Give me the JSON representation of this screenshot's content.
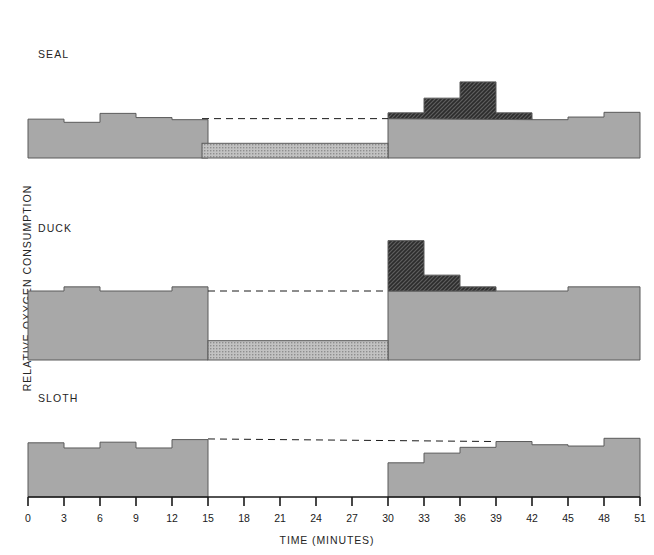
{
  "figure": {
    "ylabel": "RELATIVE OXYGEN CONSUMPTION",
    "xlabel": "TIME (MINUTES)",
    "panel_titles": {
      "seal": "SEAL",
      "duck": "DUCK",
      "sloth": "SLOTH"
    },
    "colors": {
      "baseline_fill": "#a8a8a8",
      "excess_fill": "#4a4a4a",
      "deficit_fill": "#b9b9b9",
      "outline": "#5a5a5a",
      "axis": "#1a1a1a",
      "text": "#252525"
    }
  },
  "axis": {
    "tick_labels": [
      "0",
      "3",
      "6",
      "9",
      "12",
      "15",
      "18",
      "21",
      "24",
      "27",
      "30",
      "33",
      "36",
      "39",
      "42",
      "45",
      "48",
      "51"
    ],
    "tick_values": [
      0,
      3,
      6,
      9,
      12,
      15,
      18,
      21,
      24,
      27,
      30,
      33,
      36,
      39,
      42,
      45,
      48,
      51
    ],
    "xmin": 0,
    "xmax": 51
  },
  "chart_data": {
    "type": "bar",
    "title": "",
    "xlabel": "TIME (MINUTES)",
    "ylabel": "RELATIVE OXYGEN CONSUMPTION",
    "xlim": [
      0,
      51
    ],
    "grid": false,
    "legend": "none",
    "bin_width": 3,
    "annotations": [
      "Dashed line marks the pre-dive resting oxygen-consumption level, extended across the dive period.",
      "Light stippled block below the dashed line during the dive is the oxygen deficit incurred while submerged.",
      "Dark hatched blocks after the dive are the excess oxygen consumed while repaying the oxygen debt.",
      "Seal dive interval is shorter than the duck and sloth dive intervals.",
      "Sloth oxygen consumption falls to zero during its dive."
    ],
    "panels": [
      {
        "name": "SEAL",
        "dive_start": 14.5,
        "dive_end": 30,
        "predive_level": 75,
        "series": [
          {
            "name": "baseline oxygen consumption",
            "x": [
              0,
              3,
              6,
              9,
              12,
              15,
              18,
              21,
              24,
              27,
              30,
              33,
              36,
              39,
              42,
              45,
              48
            ],
            "values": [
              74,
              68,
              85,
              77,
              73,
              0,
              0,
              0,
              0,
              0,
              75,
              75,
              75,
              75,
              73,
              78,
              87
            ]
          },
          {
            "name": "oxygen debt repayment (excess)",
            "x": [
              30,
              33,
              36,
              39
            ],
            "values": [
              86,
              114,
              145,
              86
            ]
          },
          {
            "name": "oxygen deficit during dive",
            "x": [
              14.5
            ],
            "values": [
              28
            ],
            "extent_end": 30
          }
        ]
      },
      {
        "name": "DUCK",
        "dive_start": 15,
        "dive_end": 30,
        "predive_level": 100,
        "series": [
          {
            "name": "baseline oxygen consumption",
            "x": [
              0,
              3,
              6,
              9,
              12,
              15,
              18,
              21,
              24,
              27,
              30,
              33,
              36,
              39,
              42,
              45,
              48
            ],
            "values": [
              100,
              106,
              100,
              100,
              106,
              0,
              0,
              0,
              0,
              0,
              100,
              100,
              100,
              100,
              100,
              106,
              106
            ]
          },
          {
            "name": "oxygen debt repayment (excess)",
            "x": [
              30,
              33,
              36
            ],
            "values": [
              173,
              123,
              106
            ]
          },
          {
            "name": "oxygen deficit during dive",
            "x": [
              15
            ],
            "values": [
              28
            ],
            "extent_end": 30
          }
        ]
      },
      {
        "name": "SLOTH",
        "dive_start": 15,
        "dive_end": 30,
        "predive_level": 90,
        "series": [
          {
            "name": "baseline oxygen consumption",
            "x": [
              0,
              3,
              6,
              9,
              12,
              15,
              18,
              21,
              24,
              27,
              30,
              33,
              36,
              39,
              42,
              45,
              48
            ],
            "values": [
              84,
              76,
              85,
              76,
              89,
              0,
              0,
              0,
              0,
              0,
              53,
              68,
              77,
              86,
              81,
              79,
              91
            ]
          },
          {
            "name": "oxygen debt repayment (excess)",
            "x": [],
            "values": []
          },
          {
            "name": "oxygen deficit during dive",
            "x": [],
            "values": [],
            "extent_end": 30
          }
        ]
      }
    ]
  }
}
